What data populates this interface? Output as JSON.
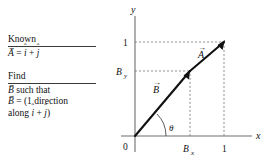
{
  "figure": {
    "known": {
      "heading": "Known",
      "equation": {
        "vector_name": "A",
        "vector_accent": "→",
        "relation": "=",
        "terms": [
          {
            "symbol": "i",
            "accent": "ˆ"
          },
          {
            "symbol": "j",
            "accent": "ˆ"
          }
        ],
        "operator": "+"
      }
    },
    "find": {
      "heading": "Find",
      "lines": [
        {
          "vector_name": "B",
          "vector_accent": "→",
          "text": " such that"
        },
        {
          "vector_name": "B",
          "vector_accent": "→",
          "text": " = (1 direction"
        },
        {
          "text": "along ",
          "terms": [
            {
              "symbol": "i",
              "accent": "ˆ"
            },
            {
              "symbol": "j",
              "accent": "ˆ"
            }
          ],
          "operator": "+",
          "closing": ")"
        }
      ]
    },
    "graph": {
      "axes": {
        "x_label": "x",
        "y_label": "y",
        "origin_label": "0"
      },
      "x_ticks": [
        {
          "label": "B",
          "subscript": "x",
          "value": 0.62
        },
        {
          "label": "1",
          "subscript": "",
          "value": 1.0
        }
      ],
      "y_ticks": [
        {
          "label": "B",
          "subscript": "y",
          "value": 0.62
        },
        {
          "label": "1",
          "subscript": "",
          "value": 1.0
        }
      ],
      "vectors": [
        {
          "name": "B",
          "accent": "→",
          "from": [
            0,
            0
          ],
          "to": [
            0.62,
            0.62
          ]
        },
        {
          "name": "A",
          "accent": "→",
          "from": [
            0,
            0
          ],
          "to": [
            1.0,
            1.0
          ]
        }
      ],
      "angle": {
        "label": "θ",
        "degrees": 45
      },
      "dashed_guides": [
        {
          "from": [
            0.62,
            0
          ],
          "to": [
            0.62,
            0.62
          ]
        },
        {
          "from": [
            0,
            0.62
          ],
          "to": [
            0.62,
            0.62
          ]
        },
        {
          "from": [
            1.0,
            0
          ],
          "to": [
            1.0,
            1.0
          ]
        },
        {
          "from": [
            0,
            1.0
          ],
          "to": [
            1.0,
            1.0
          ]
        }
      ]
    }
  },
  "colors": {
    "ink": "#111111",
    "rule": "#3a3a3a",
    "dashed": "#7a7a7a",
    "axis": "#6e6e6e"
  }
}
